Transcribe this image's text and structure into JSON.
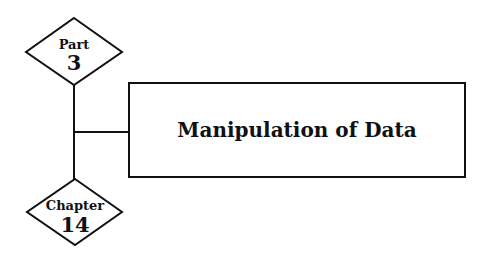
{
  "part": {
    "label": "Part",
    "number": "3"
  },
  "chapter": {
    "label": "Chapter",
    "number": "14"
  },
  "title": "Manipulation of Data",
  "colors": {
    "stroke": "#111111",
    "background": "#ffffff"
  }
}
